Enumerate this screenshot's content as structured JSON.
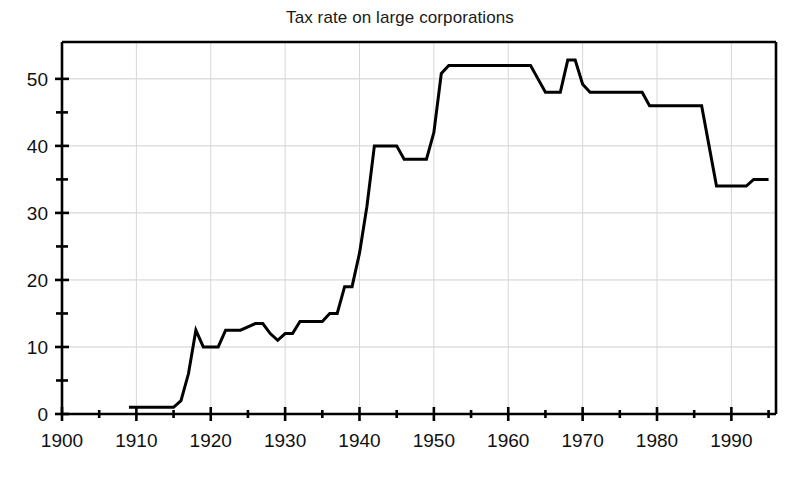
{
  "chart_data": {
    "type": "line",
    "title": "Tax rate on large corporations",
    "xlabel": "",
    "ylabel": "",
    "xlim": [
      1900,
      1996
    ],
    "ylim": [
      0,
      55.5
    ],
    "grid": true,
    "legend": null,
    "x_ticks_major": [
      1900,
      1910,
      1920,
      1930,
      1940,
      1950,
      1960,
      1970,
      1980,
      1990
    ],
    "x_tick_labels": [
      "1900",
      "1910",
      "1920",
      "1930",
      "1940",
      "1950",
      "1960",
      "1970",
      "1980",
      "1990"
    ],
    "x_ticks_minor": [
      1905,
      1915,
      1925,
      1935,
      1945,
      1955,
      1965,
      1975,
      1985,
      1995
    ],
    "y_ticks_major": [
      0,
      10,
      20,
      30,
      40,
      50
    ],
    "y_tick_labels": [
      "0",
      "10",
      "20",
      "30",
      "40",
      "50"
    ],
    "y_ticks_minor": [
      5,
      15,
      25,
      35,
      45
    ],
    "line_color": "#000000",
    "line_width": 3,
    "series": [
      {
        "name": "Tax rate on large corporations",
        "x": [
          1909,
          1910,
          1911,
          1912,
          1913,
          1914,
          1915,
          1916,
          1917,
          1918,
          1919,
          1920,
          1921,
          1922,
          1923,
          1924,
          1925,
          1926,
          1927,
          1928,
          1929,
          1930,
          1931,
          1932,
          1933,
          1934,
          1935,
          1936,
          1937,
          1938,
          1939,
          1940,
          1941,
          1942,
          1943,
          1944,
          1945,
          1946,
          1947,
          1948,
          1949,
          1950,
          1951,
          1952,
          1953,
          1954,
          1955,
          1956,
          1957,
          1958,
          1959,
          1960,
          1961,
          1962,
          1963,
          1964,
          1965,
          1966,
          1967,
          1968,
          1969,
          1970,
          1971,
          1972,
          1973,
          1974,
          1975,
          1976,
          1977,
          1978,
          1979,
          1980,
          1981,
          1982,
          1983,
          1984,
          1985,
          1986,
          1987,
          1988,
          1989,
          1990,
          1991,
          1992,
          1993,
          1994,
          1995
        ],
        "y": [
          1.0,
          1.0,
          1.0,
          1.0,
          1.0,
          1.0,
          1.0,
          2.0,
          6.0,
          12.5,
          10.0,
          10.0,
          10.0,
          12.5,
          12.5,
          12.5,
          13.0,
          13.5,
          13.5,
          12.0,
          11.0,
          12.0,
          12.0,
          13.8,
          13.8,
          13.8,
          13.8,
          15.0,
          15.0,
          19.0,
          19.0,
          24.0,
          31.0,
          40.0,
          40.0,
          40.0,
          40.0,
          38.0,
          38.0,
          38.0,
          38.0,
          42.0,
          50.8,
          52.0,
          52.0,
          52.0,
          52.0,
          52.0,
          52.0,
          52.0,
          52.0,
          52.0,
          52.0,
          52.0,
          52.0,
          50.0,
          48.0,
          48.0,
          48.0,
          52.8,
          52.8,
          49.2,
          48.0,
          48.0,
          48.0,
          48.0,
          48.0,
          48.0,
          48.0,
          48.0,
          46.0,
          46.0,
          46.0,
          46.0,
          46.0,
          46.0,
          46.0,
          46.0,
          40.0,
          34.0,
          34.0,
          34.0,
          34.0,
          34.0,
          35.0,
          35.0,
          35.0
        ]
      }
    ],
    "annotations": [
      {
        "text": "Flat near 1% before 1916",
        "x": 1912,
        "y": 1.0
      },
      {
        "text": "Wartime spike 1918",
        "x": 1918,
        "y": 12.5
      },
      {
        "text": "Rapid WWII rise 1940-1942",
        "x": 1942,
        "y": 40.0
      },
      {
        "text": "Long 52% plateau 1952-1963",
        "x": 1957,
        "y": 52.0
      },
      {
        "text": "Surcharge peak 1968",
        "x": 1968,
        "y": 52.8
      },
      {
        "text": "Tax Reform Act drop 1987",
        "x": 1987,
        "y": 34.0
      }
    ]
  }
}
